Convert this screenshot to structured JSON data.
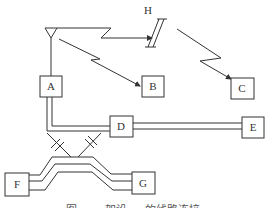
{
  "diagram": {
    "nodes": {
      "A": {
        "label": "A"
      },
      "B": {
        "label": "B"
      },
      "C": {
        "label": "C"
      },
      "D": {
        "label": "D"
      },
      "E": {
        "label": "E"
      },
      "F": {
        "label": "F"
      },
      "G": {
        "label": "G"
      }
    },
    "relay_label": "H",
    "caption": "图 …… 架设 … 的线路连接"
  },
  "colors": {
    "stroke": "#333333",
    "background": "#ffffff"
  }
}
